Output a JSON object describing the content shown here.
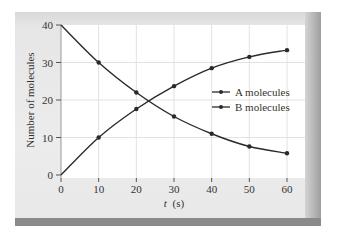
{
  "chart_data": {
    "type": "line",
    "title": "",
    "xlabel_italic": "t",
    "xlabel_unit": "(s)",
    "xlabel": "t (s)",
    "ylabel": "Number of molecules",
    "x": [
      0,
      10,
      20,
      30,
      40,
      50,
      60
    ],
    "series": [
      {
        "name": "A molecules",
        "values": [
          0,
          10,
          17.6,
          23.7,
          28.5,
          31.5,
          33.3
        ]
      },
      {
        "name": "B molecules",
        "values": [
          40,
          30,
          22,
          15.6,
          11,
          7.6,
          5.8
        ]
      }
    ],
    "xlim": [
      0,
      60
    ],
    "ylim": [
      0,
      40
    ],
    "xticks": [
      "0",
      "10",
      "20",
      "30",
      "40",
      "50",
      "60"
    ],
    "yticks": [
      "0",
      "10",
      "20",
      "30",
      "40"
    ],
    "grid": true,
    "legend_position": "center-right",
    "colors": {
      "line": "#2a2a2a",
      "grid": "#e2e2e2",
      "plot_bg": "#ffffff",
      "panel_bg": "#e8e8e8"
    }
  }
}
